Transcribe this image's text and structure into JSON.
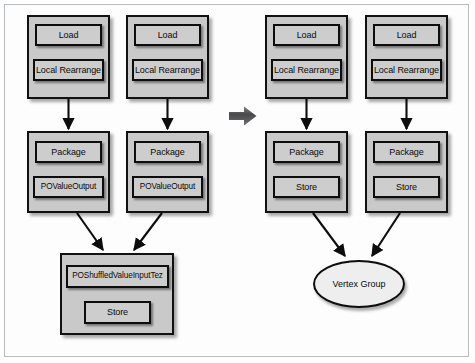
{
  "figure": {
    "background_color": "#ffffff",
    "frame_border_color": "#b9bcbe",
    "node_fill": "#cdcdcd",
    "group_fill": "#c9c9c9",
    "ellipse_fill": "#eeeeee",
    "stroke_color": "#0d0d0d",
    "transform_arrow_color": "#59595b"
  },
  "left_plan": {
    "label": "MapReduce plan",
    "groups": [
      {
        "id": "left-map-1",
        "nodes": [
          {
            "label": "Load"
          },
          {
            "label": "Local Rearrange"
          }
        ]
      },
      {
        "id": "left-map-2",
        "nodes": [
          {
            "label": "Load"
          },
          {
            "label": "Local Rearrange"
          }
        ]
      },
      {
        "id": "left-reduce-1",
        "nodes": [
          {
            "label": "Package"
          },
          {
            "label": "POValueOutput"
          }
        ]
      },
      {
        "id": "left-reduce-2",
        "nodes": [
          {
            "label": "Package"
          },
          {
            "label": "POValueOutput"
          }
        ]
      },
      {
        "id": "left-merge",
        "nodes": [
          {
            "label": "POShuffledValueInputTez"
          },
          {
            "label": "Store"
          }
        ]
      }
    ]
  },
  "transform": {
    "arrow_label": "translates to",
    "icon": "right-arrow-icon"
  },
  "right_plan": {
    "label": "Tez plan",
    "groups": [
      {
        "id": "right-vertex-1",
        "nodes": [
          {
            "label": "Load"
          },
          {
            "label": "Local Rearrange"
          }
        ]
      },
      {
        "id": "right-vertex-2",
        "nodes": [
          {
            "label": "Load"
          },
          {
            "label": "Local Rearrange"
          }
        ]
      },
      {
        "id": "right-vertex-3",
        "nodes": [
          {
            "label": "Package"
          },
          {
            "label": "Store"
          }
        ]
      },
      {
        "id": "right-vertex-4",
        "nodes": [
          {
            "label": "Package"
          },
          {
            "label": "Store"
          }
        ]
      }
    ],
    "vertex_group": {
      "label": "Vertex Group"
    }
  }
}
